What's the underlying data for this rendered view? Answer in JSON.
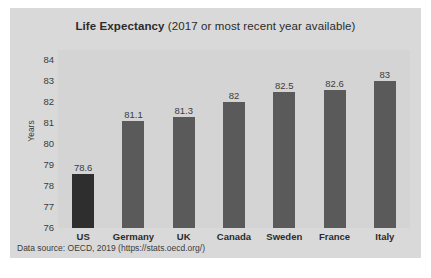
{
  "chart_data": {
    "type": "bar",
    "title": "Life Expectancy (2017 or most recent year available)",
    "title_bold": "Life Expectancy",
    "title_rest": " (2017 or most recent year available)",
    "xlabel": "",
    "ylabel": "Years",
    "ylim": [
      76,
      84.5
    ],
    "yticks": [
      76,
      77,
      78,
      79,
      80,
      81,
      82,
      83,
      84
    ],
    "ytick_labels": [
      "76",
      "77",
      "78",
      "79",
      "80",
      "81",
      "82",
      "83",
      "84"
    ],
    "grid": false,
    "legend": false,
    "categories": [
      "US",
      "Germany",
      "UK",
      "Canada",
      "Sweden",
      "France",
      "Italy"
    ],
    "values": [
      78.6,
      81.1,
      81.3,
      82,
      82.5,
      82.6,
      83
    ],
    "value_labels": [
      "78.6",
      "81.1",
      "81.3",
      "82",
      "82.5",
      "82.6",
      "83"
    ],
    "bar_colors": [
      "#2e2e2e",
      "#5a5a5a",
      "#5a5a5a",
      "#5a5a5a",
      "#5a5a5a",
      "#5a5a5a",
      "#5a5a5a"
    ],
    "highlight_category": "US",
    "annotation": "Data source: OECD, 2019 (https://stats.oecd.org/)",
    "panel_color": "#d9d9d9",
    "plot_color": "#d4d4d4",
    "text_color": "#3c3c3c"
  },
  "source": {
    "note": "Data source: OECD, 2019 (https://stats.oecd.org/)"
  }
}
